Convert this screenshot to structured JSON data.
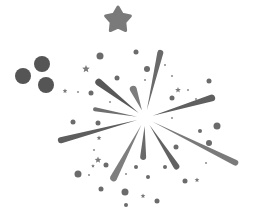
{
  "illustration": {
    "subject": "firework-burst",
    "background": "#ffffff",
    "center": [
      145,
      118
    ],
    "colors": {
      "dark": "#555555",
      "mid": "#6a6a6a",
      "light": "#7d7d7d",
      "pale": "#8e8e8e"
    },
    "big_star": {
      "x": 118,
      "y": 20,
      "r": 13,
      "color": "#7a7a7a"
    },
    "cluster_dots": [
      {
        "x": 23,
        "y": 76,
        "r": 8
      },
      {
        "x": 42,
        "y": 64,
        "r": 8
      },
      {
        "x": 46,
        "y": 85,
        "r": 8
      }
    ],
    "rays": [
      {
        "name": "ray-top",
        "tip": [
          161,
          50
        ],
        "width": 6,
        "color": "#6a6a6a"
      },
      {
        "name": "ray-upper-left-long",
        "tip": [
          96,
          80
        ],
        "width": 7,
        "color": "#585858"
      },
      {
        "name": "ray-upper-left-short",
        "tip": [
          132,
          86
        ],
        "width": 7,
        "color": "#7d7d7d"
      },
      {
        "name": "ray-left-thin",
        "tip": [
          93,
          109
        ],
        "width": 4,
        "color": "#6f6f6f"
      },
      {
        "name": "ray-left-long",
        "tip": [
          58,
          141
        ],
        "width": 6,
        "color": "#5e5e5e"
      },
      {
        "name": "ray-upper-right",
        "tip": [
          215,
          97
        ],
        "width": 7,
        "color": "#5f5f5f"
      },
      {
        "name": "ray-right-long",
        "tip": [
          238,
          164
        ],
        "width": 6,
        "color": "#7a7a7a"
      },
      {
        "name": "ray-lower-right",
        "tip": [
          178,
          169
        ],
        "width": 6,
        "color": "#626262"
      },
      {
        "name": "ray-bottom",
        "tip": [
          143,
          160
        ],
        "width": 6,
        "color": "#6a6a6a"
      },
      {
        "name": "ray-lower-left",
        "tip": [
          112,
          181
        ],
        "width": 7,
        "color": "#7e7e7e"
      }
    ],
    "dots": [
      {
        "x": 100,
        "y": 56,
        "r": 3.5
      },
      {
        "x": 136,
        "y": 52,
        "r": 2.5
      },
      {
        "x": 147,
        "y": 69,
        "r": 3
      },
      {
        "x": 117,
        "y": 78,
        "r": 2.5
      },
      {
        "x": 91,
        "y": 93,
        "r": 2.5
      },
      {
        "x": 209,
        "y": 81,
        "r": 2.5
      },
      {
        "x": 172,
        "y": 98,
        "r": 2.5
      },
      {
        "x": 73,
        "y": 122,
        "r": 2.5
      },
      {
        "x": 98,
        "y": 123,
        "r": 2.5
      },
      {
        "x": 217,
        "y": 126,
        "r": 3.5
      },
      {
        "x": 209,
        "y": 143,
        "r": 3
      },
      {
        "x": 200,
        "y": 131,
        "r": 2
      },
      {
        "x": 176,
        "y": 147,
        "r": 2.5
      },
      {
        "x": 106,
        "y": 165,
        "r": 2.5
      },
      {
        "x": 78,
        "y": 174,
        "r": 3.5
      },
      {
        "x": 136,
        "y": 167,
        "r": 2
      },
      {
        "x": 148,
        "y": 177,
        "r": 2
      },
      {
        "x": 165,
        "y": 167,
        "r": 2
      },
      {
        "x": 185,
        "y": 181,
        "r": 2.5
      },
      {
        "x": 101,
        "y": 189,
        "r": 2.5
      },
      {
        "x": 125,
        "y": 192,
        "r": 3.5
      },
      {
        "x": 157,
        "y": 201,
        "r": 2.5
      },
      {
        "x": 126,
        "y": 205,
        "r": 2
      }
    ],
    "tiny_dots": [
      {
        "x": 78,
        "y": 92
      },
      {
        "x": 110,
        "y": 102
      },
      {
        "x": 165,
        "y": 65
      },
      {
        "x": 172,
        "y": 76
      },
      {
        "x": 188,
        "y": 90
      },
      {
        "x": 172,
        "y": 118
      },
      {
        "x": 94,
        "y": 150
      },
      {
        "x": 89,
        "y": 175
      },
      {
        "x": 206,
        "y": 163
      },
      {
        "x": 145,
        "y": 80
      },
      {
        "x": 126,
        "y": 174
      },
      {
        "x": 196,
        "y": 99
      }
    ],
    "small_stars": [
      {
        "x": 86,
        "y": 69,
        "r": 4
      },
      {
        "x": 65,
        "y": 91,
        "r": 2.5
      },
      {
        "x": 178,
        "y": 90,
        "r": 3
      },
      {
        "x": 99,
        "y": 138,
        "r": 2.5
      },
      {
        "x": 98,
        "y": 160,
        "r": 3.5
      },
      {
        "x": 93,
        "y": 166,
        "r": 2
      },
      {
        "x": 143,
        "y": 196,
        "r": 2.5
      },
      {
        "x": 197,
        "y": 180,
        "r": 2.5
      }
    ]
  }
}
